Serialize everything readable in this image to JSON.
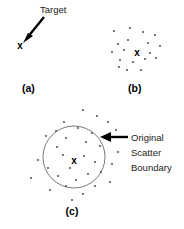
{
  "figure": {
    "background_color": "#ffffff",
    "ink_color": "#000000",
    "dot_color": "#3a3a3a",
    "circle_color": "#6b6b6b",
    "width": 184,
    "height": 229
  },
  "panels": [
    {
      "id": "a",
      "label": "(a)",
      "label_x": 22,
      "label_y": 92,
      "annotation": {
        "text": "Target",
        "text_x": 40,
        "text_y": 13,
        "arrow_from_x": 44,
        "arrow_from_y": 17,
        "arrow_to_x": 23,
        "arrow_to_y": 43
      },
      "target": {
        "marker": "x",
        "x": 20,
        "y": 49
      },
      "dots": []
    },
    {
      "id": "b",
      "label": "(b)",
      "label_x": 128,
      "label_y": 92,
      "target": {
        "marker": "x",
        "x": 137,
        "y": 52
      },
      "dots": [
        {
          "x": 114,
          "y": 31
        },
        {
          "x": 130,
          "y": 28
        },
        {
          "x": 143,
          "y": 32
        },
        {
          "x": 155,
          "y": 35
        },
        {
          "x": 118,
          "y": 44
        },
        {
          "x": 128,
          "y": 40
        },
        {
          "x": 148,
          "y": 43
        },
        {
          "x": 160,
          "y": 46
        },
        {
          "x": 112,
          "y": 52
        },
        {
          "x": 124,
          "y": 50
        },
        {
          "x": 150,
          "y": 53
        },
        {
          "x": 120,
          "y": 60
        },
        {
          "x": 133,
          "y": 62
        },
        {
          "x": 145,
          "y": 59
        },
        {
          "x": 156,
          "y": 58
        },
        {
          "x": 127,
          "y": 70
        },
        {
          "x": 141,
          "y": 70
        },
        {
          "x": 119,
          "y": 67
        }
      ]
    },
    {
      "id": "c",
      "label": "(c)",
      "label_x": 72,
      "label_y": 215,
      "target": {
        "marker": "x",
        "x": 74,
        "y": 160
      },
      "boundary": {
        "center_x": 74,
        "center_y": 157,
        "radius": 31
      },
      "annotation": {
        "lines": [
          "Original",
          "Scatter",
          "Boundary"
        ],
        "text_x": 131,
        "first_line_y": 141,
        "line_height": 15,
        "arrow_from_x": 128,
        "arrow_from_y": 137,
        "arrow_to_x": 100,
        "arrow_to_y": 137
      },
      "dots": [
        {
          "x": 83,
          "y": 110
        },
        {
          "x": 97,
          "y": 116
        },
        {
          "x": 108,
          "y": 122
        },
        {
          "x": 64,
          "y": 122
        },
        {
          "x": 46,
          "y": 136
        },
        {
          "x": 116,
          "y": 130
        },
        {
          "x": 56,
          "y": 131
        },
        {
          "x": 78,
          "y": 128
        },
        {
          "x": 92,
          "y": 133
        },
        {
          "x": 66,
          "y": 138
        },
        {
          "x": 86,
          "y": 142
        },
        {
          "x": 57,
          "y": 147
        },
        {
          "x": 100,
          "y": 146
        },
        {
          "x": 38,
          "y": 160
        },
        {
          "x": 48,
          "y": 168
        },
        {
          "x": 63,
          "y": 155
        },
        {
          "x": 84,
          "y": 156
        },
        {
          "x": 95,
          "y": 162
        },
        {
          "x": 70,
          "y": 168
        },
        {
          "x": 58,
          "y": 176
        },
        {
          "x": 88,
          "y": 174
        },
        {
          "x": 101,
          "y": 172
        },
        {
          "x": 112,
          "y": 164
        },
        {
          "x": 76,
          "y": 180
        },
        {
          "x": 66,
          "y": 186
        },
        {
          "x": 95,
          "y": 186
        },
        {
          "x": 110,
          "y": 182
        },
        {
          "x": 50,
          "y": 190
        },
        {
          "x": 83,
          "y": 194
        },
        {
          "x": 118,
          "y": 152
        },
        {
          "x": 31,
          "y": 178
        },
        {
          "x": 72,
          "y": 200
        }
      ]
    }
  ]
}
